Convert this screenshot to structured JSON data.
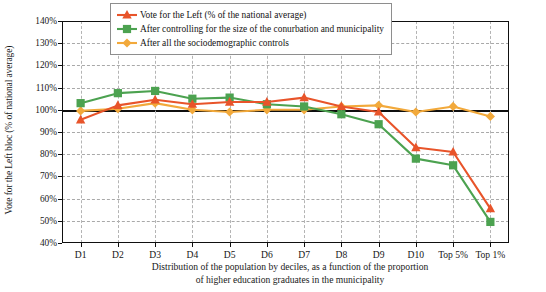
{
  "chart_data": {
    "type": "line",
    "title": "",
    "xlabel": "Distribution of the population by deciles, as a function of the proportion of higher education graduates in the municipality",
    "xlabel_line1": "Distribution of the population by deciles, as a function of the proportion",
    "xlabel_line2": "of higher education graduates in the municipality",
    "ylabel": "Vote for the Left bloc (% of national average)",
    "categories": [
      "D1",
      "D2",
      "D3",
      "D4",
      "D5",
      "D6",
      "D7",
      "D8",
      "D9",
      "D10",
      "Top 5%",
      "Top 1%"
    ],
    "ylim": [
      40,
      140
    ],
    "yticks": [
      40,
      50,
      60,
      70,
      80,
      90,
      100,
      110,
      120,
      130,
      140
    ],
    "ytick_labels": [
      "40%",
      "50%",
      "60%",
      "70%",
      "80%",
      "90%",
      "100%",
      "110%",
      "120%",
      "130%",
      "140%"
    ],
    "grid": true,
    "legend_position": "top-center",
    "reference_line": 100,
    "series": [
      {
        "name": "Vote for the Left (% of the national average)",
        "color": "#E8542A",
        "marker": "triangle",
        "values": [
          95.5,
          102.0,
          104.5,
          102.5,
          103.5,
          103.5,
          105.5,
          101.5,
          99.0,
          83.0,
          81.0,
          55.5
        ]
      },
      {
        "name": "After controlling for the size of the conurbation and municipality",
        "color": "#4CA250",
        "marker": "square",
        "values": [
          103.0,
          107.5,
          108.5,
          105.0,
          105.5,
          102.5,
          101.5,
          98.0,
          93.5,
          78.0,
          75.0,
          49.5
        ]
      },
      {
        "name": "After all the sociodemographic controls",
        "color": "#F2A93B",
        "marker": "diamond",
        "values": [
          99.5,
          100.5,
          103.0,
          100.0,
          99.0,
          100.0,
          100.0,
          101.5,
          102.0,
          99.0,
          101.5,
          97.0
        ]
      }
    ]
  },
  "legend": {
    "items": [
      {
        "label": "Vote for the Left (% of the national average)"
      },
      {
        "label": "After controlling for the size of the conurbation and municipality"
      },
      {
        "label": "After all the sociodemographic controls"
      }
    ]
  }
}
